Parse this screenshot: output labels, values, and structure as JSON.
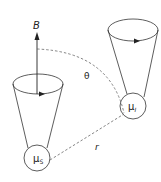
{
  "diagram": {
    "type": "physics-schematic",
    "colors": {
      "stroke": "#333333",
      "dashed": "#666666",
      "background": "#ffffff"
    },
    "labels": {
      "field": "B",
      "angle": "θ",
      "distance": "r",
      "moment_s": "μ",
      "moment_s_sub": "S",
      "moment_i": "μ",
      "moment_i_sub": "I"
    },
    "elements": {
      "left_cone": {
        "moment": "μS",
        "top_ellipse": {
          "cx": 38,
          "cy": 84,
          "rx": 25,
          "ry": 10
        },
        "sphere": {
          "cx": 37,
          "cy": 158,
          "r": 13
        }
      },
      "right_cone": {
        "moment": "μI",
        "top_ellipse": {
          "cx": 133,
          "cy": 30,
          "rx": 25,
          "ry": 11
        },
        "sphere": {
          "cx": 133,
          "cy": 106,
          "r": 13
        }
      },
      "field_arrow": {
        "x": 37,
        "y_start": 93,
        "y_end": 33
      }
    }
  }
}
